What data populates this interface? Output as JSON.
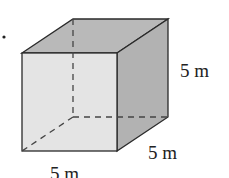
{
  "diagram": {
    "type": "cube",
    "labels": {
      "height": "5 m",
      "depth": "5 m",
      "width": "5 m"
    },
    "colors": {
      "front_face": "#e4e4e4",
      "side_face": "#b2b2b2",
      "top_face": "#b9b9b9",
      "edge": "#2a2a2a",
      "hidden_edge": "#444444"
    }
  }
}
